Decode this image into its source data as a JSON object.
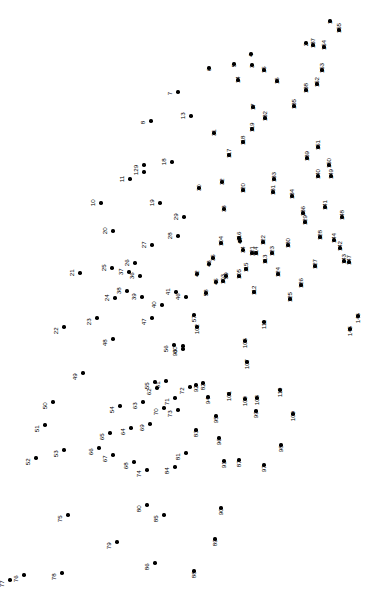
{
  "page": {
    "background_color": "#ffffff",
    "dot_color": "#000000",
    "label_color": "#000000",
    "width": 387,
    "height": 613,
    "label_rotation_degrees": -90
  },
  "chart_data": {
    "type": "scatter",
    "xlabel": "",
    "ylabel": "",
    "xlim": [
      0,
      387
    ],
    "ylim": [
      0,
      613
    ],
    "grid": false,
    "legend": "none",
    "point_count": 155,
    "labels": [
      "1",
      "2",
      "3",
      "4",
      "5",
      "6",
      "7",
      "8",
      "9",
      "10",
      "11",
      "12",
      "13",
      "14",
      "15",
      "16",
      "17",
      "18",
      "19",
      "20",
      "21",
      "22",
      "23",
      "24",
      "25",
      "26",
      "27",
      "28",
      "29",
      "30",
      "31",
      "32",
      "33",
      "34",
      "35",
      "36",
      "37",
      "38",
      "39",
      "40",
      "41",
      "42",
      "43",
      "44",
      "45",
      "46",
      "47",
      "48",
      "49",
      "50",
      "51",
      "52",
      "53",
      "54",
      "55",
      "56",
      "57",
      "58",
      "59",
      "60",
      "61",
      "62",
      "63",
      "64",
      "65",
      "66",
      "67",
      "68",
      "69",
      "70",
      "71",
      "72",
      "73",
      "74",
      "75",
      "76",
      "77",
      "78",
      "79",
      "80",
      "81",
      "82",
      "83",
      "84",
      "85",
      "86",
      "87",
      "88",
      "89",
      "90",
      "91",
      "92",
      "93",
      "94",
      "95",
      "96",
      "97",
      "98",
      "99",
      "100",
      "101",
      "102",
      "103",
      "104",
      "105",
      "106",
      "107",
      "108",
      "109",
      "110",
      "111",
      "112",
      "113",
      "114",
      "115",
      "116",
      "117",
      "118",
      "119",
      "120",
      "121",
      "122",
      "123",
      "124",
      "125",
      "126",
      "127",
      "128",
      "129",
      "130",
      "131",
      "132",
      "133",
      "134",
      "135",
      "136",
      "137",
      "138",
      "139",
      "140",
      "141",
      "142",
      "143",
      "144",
      "145",
      "146",
      "147",
      "148",
      "149",
      "150",
      "151",
      "152",
      "153",
      "154",
      "155"
    ],
    "x": [
      330,
      306,
      252,
      251,
      234,
      209,
      178,
      151,
      144,
      101,
      130,
      144,
      191,
      238,
      264,
      277,
      253,
      172,
      160,
      113,
      80,
      64,
      97,
      115,
      112,
      135,
      152,
      178,
      184,
      199,
      214,
      222,
      224,
      243,
      213,
      140,
      129,
      127,
      142,
      162,
      176,
      197,
      209,
      240,
      216,
      186,
      152,
      113,
      83,
      53,
      45,
      36,
      64,
      120,
      155,
      174,
      194,
      206,
      226,
      183,
      166,
      157,
      143,
      131,
      110,
      99,
      113,
      134,
      150,
      164,
      175,
      190,
      178,
      147,
      68,
      24,
      10,
      62,
      117,
      147,
      186,
      203,
      196,
      175,
      164,
      155,
      239,
      194,
      215,
      221,
      224,
      196,
      183,
      208,
      216,
      219,
      264,
      281,
      256,
      245,
      229,
      197,
      223,
      221,
      239,
      245,
      247,
      257,
      293,
      280,
      264,
      254,
      265,
      256,
      246,
      239,
      229,
      243,
      252,
      243,
      252,
      263,
      272,
      278,
      290,
      301,
      315,
      320,
      305,
      288,
      273,
      265,
      274,
      292,
      294,
      303,
      313,
      306,
      307,
      318,
      325,
      340,
      344,
      334,
      350,
      358,
      349,
      342,
      331,
      329,
      318,
      317,
      322,
      324,
      339
    ],
    "y": [
      592,
      570,
      548,
      559,
      549,
      545,
      521,
      492,
      448,
      410,
      434,
      441,
      497,
      533,
      543,
      532,
      506,
      451,
      410,
      382,
      340,
      286,
      295,
      315,
      345,
      350,
      368,
      377,
      396,
      425,
      480,
      431,
      404,
      363,
      355,
      337,
      341,
      322,
      316,
      308,
      321,
      339,
      349,
      372,
      331,
      316,
      295,
      274,
      240,
      211,
      188,
      155,
      163,
      207,
      231,
      268,
      298,
      320,
      337,
      267,
      232,
      225,
      211,
      185,
      180,
      165,
      158,
      151,
      189,
      205,
      215,
      226,
      203,
      143,
      98,
      38,
      33,
      40,
      71,
      108,
      160,
      230,
      183,
      146,
      98,
      50,
      153,
      42,
      74,
      105,
      152,
      228,
      264,
      216,
      197,
      175,
      148,
      168,
      202,
      214,
      219,
      286,
      332,
      370,
      337,
      272,
      251,
      215,
      199,
      223,
      291,
      321,
      352,
      360,
      344,
      375,
      458,
      471,
      484,
      423,
      360,
      371,
      360,
      339,
      314,
      328,
      347,
      376,
      391,
      368,
      421,
      495,
      434,
      417,
      507,
      400,
      568,
      523,
      455,
      437,
      406,
      365,
      352,
      373,
      284,
      297,
      351,
      396,
      437,
      448,
      466,
      529,
      543,
      566,
      583
    ]
  }
}
